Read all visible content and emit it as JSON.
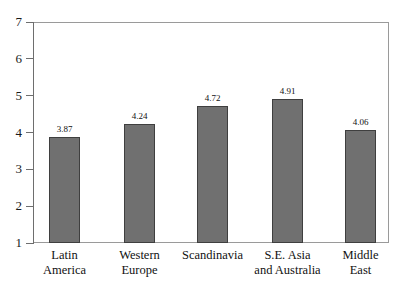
{
  "chart_data": {
    "type": "bar",
    "title": "",
    "subtitle": "",
    "xlabel": "",
    "ylabel": "",
    "ylim": [
      1,
      7
    ],
    "yticks": [
      "1",
      "2",
      "3",
      "4",
      "5",
      "6",
      "7"
    ],
    "grid": false,
    "legend": null,
    "bar_color": "#707070",
    "bar_edge_color": "#3f3f3f",
    "axis_color": "#6e6e6e",
    "categories": [
      "Latin America",
      "Western Europe",
      "Scandinavia",
      "S.E. Asia and Australia",
      "Middle East"
    ],
    "category_lines": [
      {
        "line1": "Latin",
        "line2": "America"
      },
      {
        "line1": "Western",
        "line2": "Europe"
      },
      {
        "line1": "Scandinavia",
        "line2": ""
      },
      {
        "line1": "S.E. Asia",
        "line2": "and Australia"
      },
      {
        "line1": "Middle",
        "line2": "East"
      }
    ],
    "values": [
      3.87,
      4.24,
      4.72,
      4.91,
      4.06
    ],
    "value_labels": [
      "3.87",
      "4.24",
      "4.72",
      "4.91",
      "4.06"
    ]
  }
}
